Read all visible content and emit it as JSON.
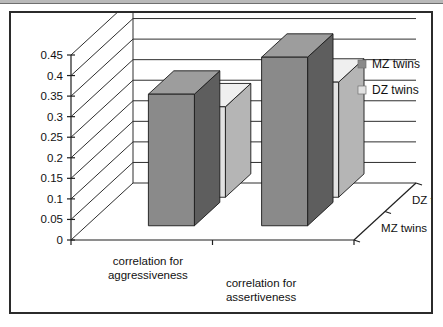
{
  "figure": {
    "frame_color": "#2b2b2b",
    "background": "#ffffff"
  },
  "chart_data": {
    "type": "bar",
    "title": "",
    "xlabel": "",
    "ylabel": "",
    "categories": [
      "correlation for aggressiveness",
      "correlation for assertiveness"
    ],
    "category_lines": [
      [
        "correlation for",
        "aggressiveness"
      ],
      [
        "correlation for",
        "assertiveness"
      ]
    ],
    "series": [
      {
        "name": "MZ twins",
        "values": [
          0.32,
          0.41
        ],
        "color": "#8a8a8a"
      },
      {
        "name": "DZ twins",
        "values": [
          0.22,
          0.28
        ],
        "color": "#e2e2e2"
      }
    ],
    "depth_axis_labels": [
      "MZ twins",
      "DZ twins"
    ],
    "ylim": [
      0,
      0.45
    ],
    "ytick_labels": [
      "0",
      "0.05",
      "0.1",
      "0.15",
      "0.2",
      "0.25",
      "0.3",
      "0.35",
      "0.4",
      "0.45"
    ],
    "ytick_values": [
      0,
      0.05,
      0.1,
      0.15,
      0.2,
      0.25,
      0.3,
      0.35,
      0.4,
      0.45
    ],
    "grid": true,
    "three_d": true,
    "legend_position": "right-top",
    "legend": [
      {
        "label": "MZ twins",
        "swatch": "#8a8a8a"
      },
      {
        "label": "DZ twins",
        "swatch": "#e2e2e2"
      }
    ]
  },
  "colors": {
    "mz_front": "#8a8a8a",
    "mz_side": "#5e5e5e",
    "mz_top": "#9d9d9d",
    "dz_front": "#e2e2e2",
    "dz_side": "#b5b5b5",
    "dz_top": "#efefef",
    "grid": "#2e2e2e",
    "axis": "#1f1f1f",
    "text": "#111111"
  }
}
